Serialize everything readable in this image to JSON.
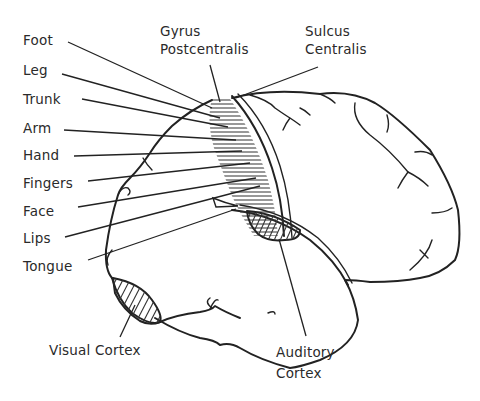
{
  "diagram": {
    "labels": {
      "foot": "Foot",
      "leg": "Leg",
      "trunk": "Trunk",
      "arm": "Arm",
      "hand": "Hand",
      "fingers": "Fingers",
      "face": "Face",
      "lips": "Lips",
      "tongue": "Tongue",
      "gyrus_line1": "Gyrus",
      "gyrus_line2": "Postcentralis",
      "sulcus_line1": "Sulcus",
      "sulcus_line2": "Centralis",
      "visual_cortex": "Visual Cortex",
      "auditory_line1": "Auditory",
      "auditory_line2": "Cortex"
    },
    "colors": {
      "ink": "#222222",
      "background": "#ffffff"
    }
  }
}
